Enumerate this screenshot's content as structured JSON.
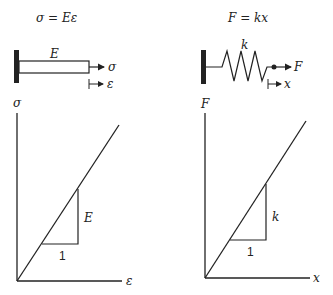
{
  "left_panel": {
    "equation": "σ = Eε",
    "bar_label": "E",
    "force_label": "σ",
    "displacement_label": "ε",
    "graph": {
      "y_axis_label": "σ",
      "x_axis_label": "ε",
      "slope_run_label": "1",
      "slope_rise_label": "E"
    }
  },
  "right_panel": {
    "equation": "F = kx",
    "spring_label": "k",
    "force_label": "F",
    "displacement_label": "x",
    "graph": {
      "y_axis_label": "F",
      "x_axis_label": "x",
      "slope_run_label": "1",
      "slope_rise_label": "k"
    }
  },
  "colors": {
    "ink": "#222222",
    "background": "#ffffff"
  }
}
